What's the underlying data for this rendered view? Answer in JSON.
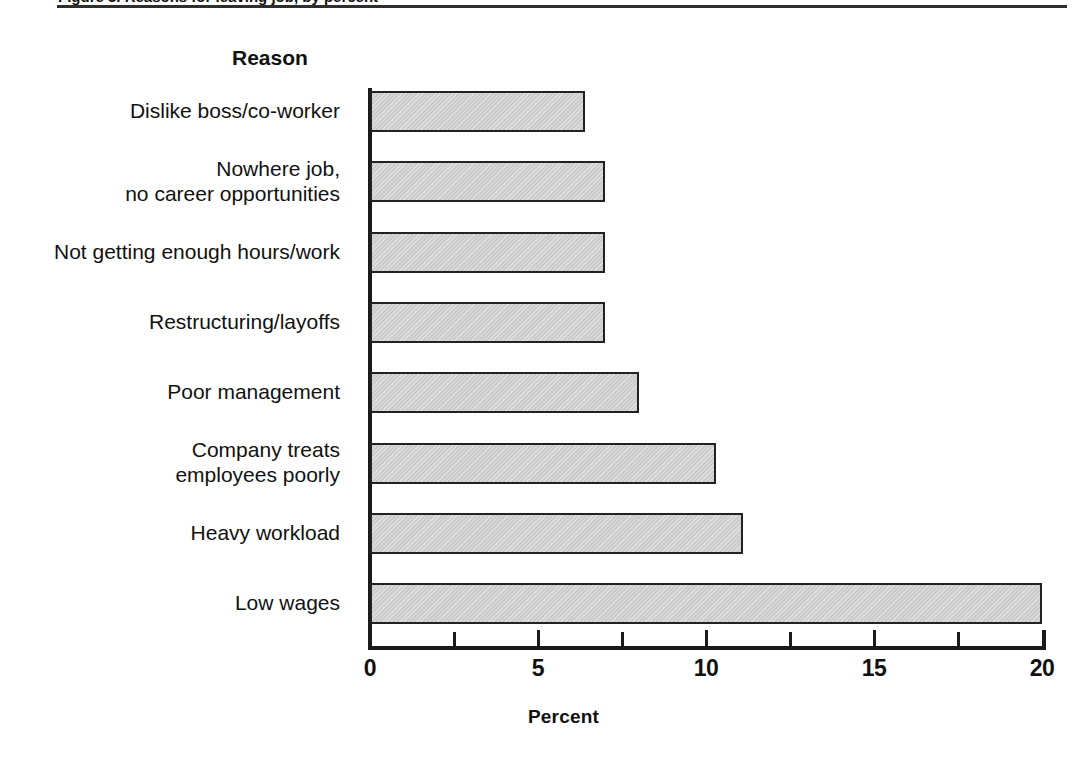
{
  "figure": {
    "top_caption_partial": "Figure 3. Reasons for leaving job, by percent",
    "category_axis_title": "Reason",
    "value_axis_title": "Percent"
  },
  "chart_data": {
    "type": "bar",
    "orientation": "horizontal",
    "title": "",
    "xlabel": "Percent",
    "ylabel": "Reason",
    "xlim": [
      0,
      20
    ],
    "xticks": [
      0,
      5,
      10,
      15,
      20
    ],
    "xtick_labels": [
      "0",
      "5",
      "10",
      "15",
      "20"
    ],
    "minor_xticks": [
      2.5,
      7.5,
      12.5,
      17.5
    ],
    "grid": false,
    "legend": "none",
    "bar_fill_color": "#cbcbcb",
    "bar_edge_color": "#222222",
    "categories": [
      "Dislike boss/co-worker",
      "Nowhere job,\nno career opportunities",
      "Not getting enough hours/work",
      "Restructuring/layoffs",
      "Poor management",
      "Company treats\nemployees poorly",
      "Heavy workload",
      "Low wages"
    ],
    "values": [
      6.4,
      7.0,
      7.0,
      7.0,
      8.0,
      10.3,
      11.1,
      20.0
    ]
  }
}
